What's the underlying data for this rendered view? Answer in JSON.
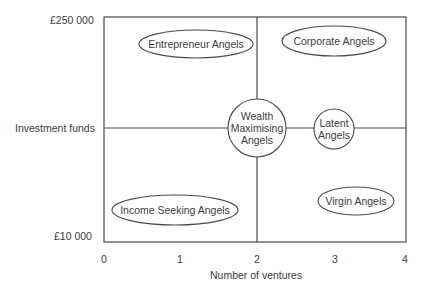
{
  "diagram": {
    "cropped_title": "",
    "y_axis": {
      "label": "Investment funds",
      "top_value": "£250 000",
      "bottom_value": "£10 000"
    },
    "x_axis": {
      "label": "Number of ventures",
      "ticks": [
        "0",
        "1",
        "2",
        "3",
        "4"
      ]
    },
    "quadrants": {
      "top_left": "Entrepreneur Angels",
      "top_right": "Corporate Angels",
      "bottom_left": "Income Seeking Angels",
      "bottom_right": "Virgin Angels"
    },
    "center_circle": {
      "line1": "Wealth",
      "line2": "Maximising",
      "line3": "Angels"
    },
    "latent_circle": {
      "line1": "Latent",
      "line2": "Angels"
    },
    "colors": {
      "line": "#4a4a4a",
      "background": "#ffffff",
      "text": "#3c3c3c"
    }
  }
}
